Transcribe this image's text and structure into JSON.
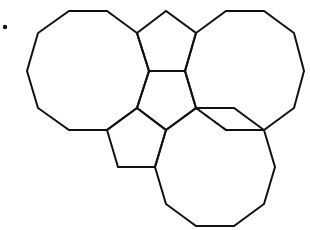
{
  "figure": {
    "bullet": {
      "x": 5,
      "y": 27,
      "r": 2.2
    },
    "stroke_color": "#111111",
    "background": "#ffffff",
    "shapes": [
      {
        "name": "decagon-left",
        "type": "decagon",
        "points": "69,11 107,11 137,33 149,71 137,108 107,130 69,130 38,108 27,71 38,33"
      },
      {
        "name": "decagon-right",
        "type": "decagon",
        "points": "226,11 264,11 294,33 304,71 294,108 264,130 226,130 196,108 185,71 196,33"
      },
      {
        "name": "decagon-bottom",
        "type": "decagon",
        "points": "196,108 234,108 264,130 275,167 264,204 234,226 196,226 166,204 155,167 166,130"
      },
      {
        "name": "pentagon-top",
        "type": "pentagon",
        "points": "137,33 166,11 196,33 185,71 149,71"
      },
      {
        "name": "pentagon-center",
        "type": "pentagon",
        "points": "149,71 185,71 196,108 166,130 137,108"
      },
      {
        "name": "pentagon-lower",
        "type": "pentagon",
        "points": "137,108 166,130 155,167 118,167 107,130"
      }
    ],
    "dashed_edge": {
      "name": "hidden-edge",
      "points": "196,108 226,130 264,130"
    }
  }
}
